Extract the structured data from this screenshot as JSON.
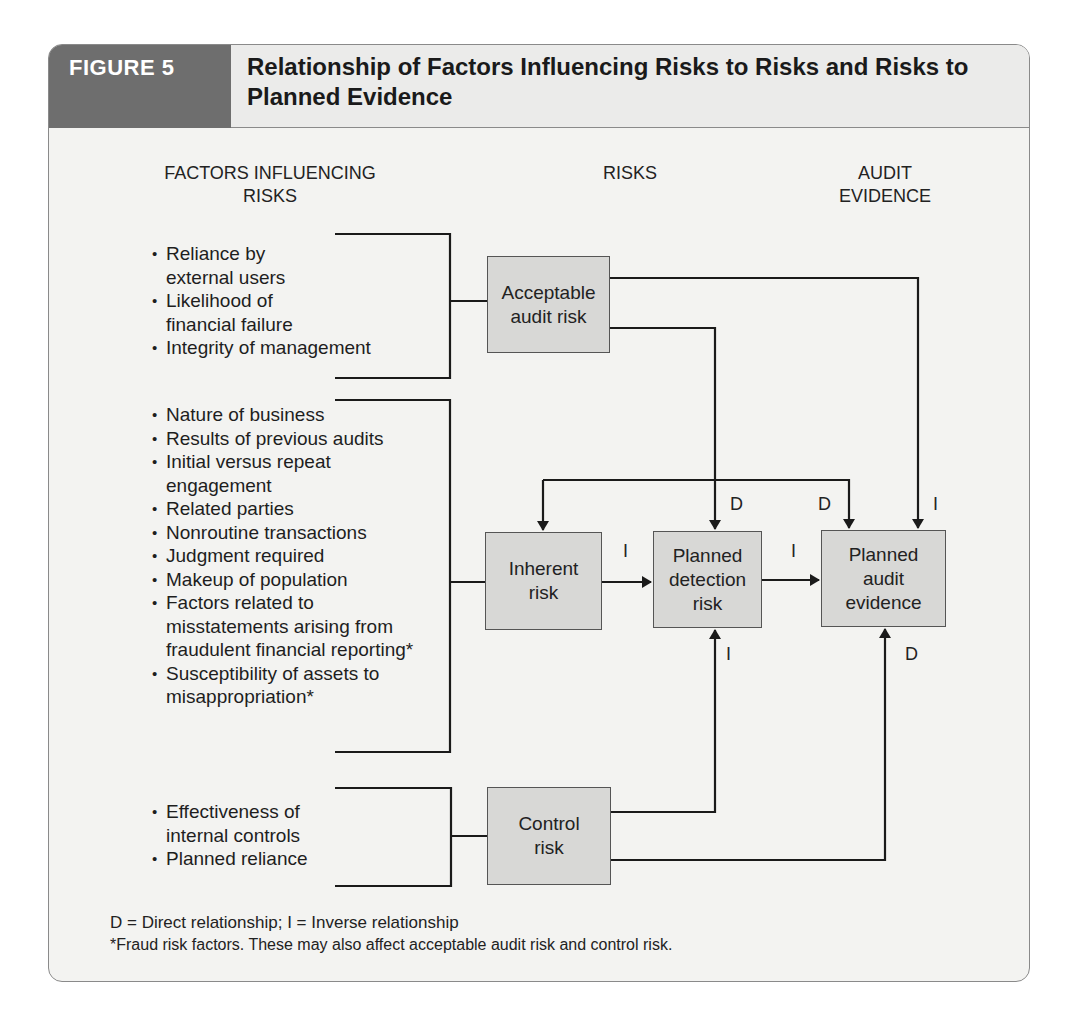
{
  "figure": {
    "label": "FIGURE 5",
    "title": "Relationship of Factors Influencing Risks to Risks and Risks to Planned Evidence"
  },
  "columns": {
    "factors": "FACTORS INFLUENCING RISKS",
    "risks": "RISKS",
    "evidence": "AUDIT EVIDENCE"
  },
  "factor_groups": [
    {
      "target": "Acceptable audit risk",
      "items": [
        "Reliance by external users",
        "Likelihood of financial failure",
        "Integrity of management"
      ]
    },
    {
      "target": "Inherent risk",
      "items": [
        "Nature of business",
        "Results of previous audits",
        "Initial versus repeat engagement",
        "Related parties",
        "Nonroutine transactions",
        "Judgment required",
        "Makeup of population",
        "Factors related to misstatements arising from fraudulent financial reporting*",
        "Susceptibility of assets to misappropriation*"
      ]
    },
    {
      "target": "Control risk",
      "items": [
        "Effectiveness of internal controls",
        "Planned reliance"
      ]
    }
  ],
  "boxes": {
    "acceptable_audit_risk": "Acceptable audit risk",
    "inherent_risk": "Inherent risk",
    "planned_detection_risk": "Planned detection risk",
    "planned_audit_evidence": "Planned audit evidence",
    "control_risk": "Control risk"
  },
  "relations": {
    "aar_to_pdr": "D",
    "ir_to_pae": "D",
    "aar_to_pae": "I",
    "ir_to_pdr": "I",
    "pdr_to_pae": "I",
    "cr_to_pdr": "I",
    "cr_to_pae": "D"
  },
  "legend": {
    "key": "D = Direct relationship; I = Inverse relationship",
    "footnote": "*Fraud risk factors. These may also affect acceptable audit risk and control risk."
  },
  "colors": {
    "figure_label_bg": "#6e6e6e",
    "title_bg": "#ebebea",
    "card_bg": "#f3f3f1",
    "box_fill": "#d8d8d6",
    "line": "#1a1a1a"
  }
}
